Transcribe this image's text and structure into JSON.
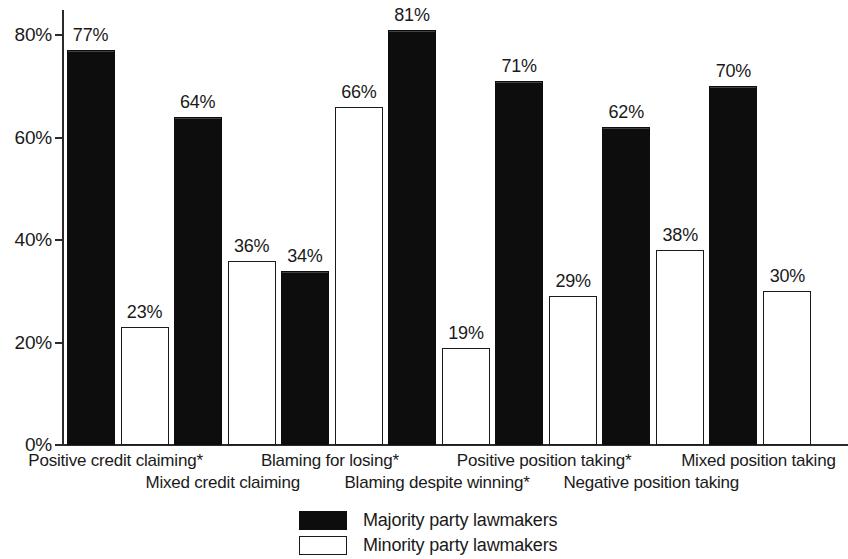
{
  "chart_data": {
    "type": "bar",
    "title": "",
    "subtitle": "",
    "xlabel": "",
    "ylabel": "",
    "ylim": [
      0,
      85
    ],
    "grid": false,
    "legend_position": "bottom",
    "value_label_suffix": "%",
    "categories": [
      "Positive credit claiming*",
      "Mixed credit claiming",
      "Blaming for losing*",
      "Blaming despite winning*",
      "Positive position taking*",
      "Negative position taking",
      "Mixed position taking"
    ],
    "series": [
      {
        "name": "Majority party lawmakers",
        "color": "#0d0d0d",
        "values": [
          77,
          64,
          34,
          81,
          71,
          62,
          70
        ],
        "labels": [
          "77%",
          "64%",
          "34%",
          "81%",
          "71%",
          "62%",
          "70%"
        ]
      },
      {
        "name": "Minority party lawmakers",
        "color": "#ffffff",
        "values": [
          23,
          36,
          66,
          19,
          29,
          38,
          30
        ],
        "labels": [
          "23%",
          "36%",
          "66%",
          "19%",
          "29%",
          "38%",
          "30%"
        ]
      }
    ],
    "yticks": [
      0,
      20,
      40,
      60,
      80
    ],
    "ytick_labels": [
      "0%",
      "20%",
      "40%",
      "60%",
      "80%"
    ]
  },
  "axis": {
    "y_labels": [
      "80%",
      "60%",
      "40%",
      "20%",
      "0%"
    ]
  },
  "legend": {
    "items": [
      {
        "label": "Majority party lawmakers",
        "swatch": "black-filled-swatch"
      },
      {
        "label": "Minority party lawmakers",
        "swatch": "white-outlined-swatch"
      }
    ]
  }
}
